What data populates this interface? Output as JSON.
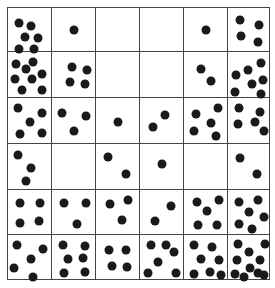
{
  "figure": {
    "title": "",
    "rows": 6,
    "cols": 6,
    "dot_color": "#1a1a1a",
    "line_color": "#444444",
    "cells": [
      [
        {
          "count": 6,
          "dots": [
            [
              11,
              15
            ],
            [
              23,
              18
            ],
            [
              17,
              29
            ],
            [
              30,
              30
            ],
            [
              11,
              41
            ],
            [
              26,
              41
            ]
          ]
        },
        {
          "count": 1,
          "dots": [
            [
              22,
              22
            ]
          ]
        },
        {
          "count": 0,
          "dots": []
        },
        {
          "count": 0,
          "dots": []
        },
        {
          "count": 1,
          "dots": [
            [
              22,
              22
            ]
          ]
        },
        {
          "count": 4,
          "dots": [
            [
              12,
              12
            ],
            [
              31,
              17
            ],
            [
              13,
              28
            ],
            [
              30,
              34
            ]
          ]
        }
      ],
      [
        {
          "count": 8,
          "dots": [
            [
              8,
              12
            ],
            [
              25,
              10
            ],
            [
              18,
              17
            ],
            [
              34,
              22
            ],
            [
              7,
              27
            ],
            [
              24,
              27
            ],
            [
              14,
              38
            ],
            [
              34,
              38
            ]
          ]
        },
        {
          "count": 4,
          "dots": [
            [
              20,
              15
            ],
            [
              35,
              18
            ],
            [
              18,
              30
            ],
            [
              33,
              32
            ]
          ]
        },
        {
          "count": 0,
          "dots": []
        },
        {
          "count": 0,
          "dots": []
        },
        {
          "count": 2,
          "dots": [
            [
              17,
              17
            ],
            [
              27,
              29
            ]
          ]
        },
        {
          "count": 7,
          "dots": [
            [
              33,
              11
            ],
            [
              20,
              18
            ],
            [
              8,
              23
            ],
            [
              35,
              28
            ],
            [
              24,
              32
            ],
            [
              7,
              40
            ],
            [
              33,
              42
            ]
          ]
        }
      ],
      [
        {
          "count": 5,
          "dots": [
            [
              10,
              10
            ],
            [
              34,
              15
            ],
            [
              22,
              24
            ],
            [
              12,
              36
            ],
            [
              34,
              35
            ]
          ]
        },
        {
          "count": 3,
          "dots": [
            [
              10,
              15
            ],
            [
              34,
              18
            ],
            [
              22,
              33
            ]
          ]
        },
        {
          "count": 1,
          "dots": [
            [
              22,
              24
            ]
          ]
        },
        {
          "count": 2,
          "dots": [
            [
              25,
              17
            ],
            [
              13,
              29
            ]
          ]
        },
        {
          "count": 5,
          "dots": [
            [
              34,
              10
            ],
            [
              12,
              16
            ],
            [
              27,
              25
            ],
            [
              10,
              33
            ],
            [
              32,
              38
            ]
          ]
        },
        {
          "count": 6,
          "dots": [
            [
              11,
              10
            ],
            [
              32,
              14
            ],
            [
              10,
              26
            ],
            [
              27,
              24
            ],
            [
              36,
              33
            ]
          ]
        }
      ],
      [
        {
          "count": 3,
          "dots": [
            [
              10,
              11
            ],
            [
              23,
              24
            ],
            [
              18,
              37
            ]
          ]
        },
        {
          "count": 0,
          "dots": []
        },
        {
          "count": 2,
          "dots": [
            [
              12,
              13
            ],
            [
              30,
              30
            ]
          ]
        },
        {
          "count": 1,
          "dots": [
            [
              22,
              20
            ]
          ]
        },
        {
          "count": 0,
          "dots": []
        },
        {
          "count": 2,
          "dots": [
            [
              12,
              14
            ],
            [
              29,
              30
            ]
          ]
        }
      ],
      [
        {
          "count": 4,
          "dots": [
            [
              12,
              13
            ],
            [
              32,
              13
            ],
            [
              12,
              33
            ],
            [
              31,
              31
            ]
          ]
        },
        {
          "count": 3,
          "dots": [
            [
              12,
              13
            ],
            [
              34,
              13
            ],
            [
              25,
              34
            ]
          ]
        },
        {
          "count": 3,
          "dots": [
            [
              14,
              14
            ],
            [
              32,
              10
            ],
            [
              26,
              30
            ]
          ]
        },
        {
          "count": 2,
          "dots": [
            [
              31,
              16
            ],
            [
              15,
              31
            ]
          ]
        },
        {
          "count": 5,
          "dots": [
            [
              13,
              12
            ],
            [
              35,
              10
            ],
            [
              23,
              21
            ],
            [
              14,
              35
            ],
            [
              33,
              35
            ]
          ]
        },
        {
          "count": 6,
          "dots": [
            [
              11,
              12
            ],
            [
              30,
              10
            ],
            [
              21,
              22
            ],
            [
              36,
              27
            ],
            [
              11,
              34
            ],
            [
              24,
              39
            ]
          ]
        }
      ],
      [
        {
          "count": 5,
          "dots": [
            [
              9,
              10
            ],
            [
              35,
              14
            ],
            [
              23,
              24
            ],
            [
              6,
              33
            ],
            [
              25,
              42
            ]
          ]
        },
        {
          "count": 6,
          "dots": [
            [
              11,
              10
            ],
            [
              33,
              11
            ],
            [
              16,
              24
            ],
            [
              31,
              23
            ],
            [
              12,
              38
            ],
            [
              33,
              37
            ]
          ]
        },
        {
          "count": 4,
          "dots": [
            [
              13,
              15
            ],
            [
              30,
              15
            ],
            [
              16,
              31
            ],
            [
              31,
              32
            ]
          ]
        },
        {
          "count": 6,
          "dots": [
            [
              11,
              10
            ],
            [
              26,
              10
            ],
            [
              34,
              17
            ],
            [
              18,
              27
            ],
            [
              8,
              38
            ],
            [
              36,
              38
            ]
          ]
        },
        {
          "count": 7,
          "dots": [
            [
              10,
              10
            ],
            [
              28,
              12
            ],
            [
              17,
              24
            ],
            [
              35,
              25
            ],
            [
              10,
              39
            ],
            [
              26,
              37
            ],
            [
              37,
              40
            ]
          ]
        },
        {
          "count": 10,
          "dots": [
            [
              10,
              9
            ],
            [
              37,
              9
            ],
            [
              21,
              17
            ],
            [
              32,
              25
            ],
            [
              9,
              25
            ],
            [
              22,
              33
            ],
            [
              7,
              39
            ],
            [
              36,
              40
            ],
            [
              16,
              42
            ],
            [
              30,
              38
            ]
          ]
        }
      ]
    ]
  }
}
